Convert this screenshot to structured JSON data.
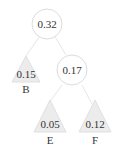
{
  "tree": {
    "root": {
      "value": "0.32"
    },
    "internal": {
      "value": "0.17"
    },
    "leaves": [
      {
        "value": "0.15",
        "label": "B"
      },
      {
        "value": "0.05",
        "label": "E"
      },
      {
        "value": "0.12",
        "label": "F"
      }
    ]
  }
}
